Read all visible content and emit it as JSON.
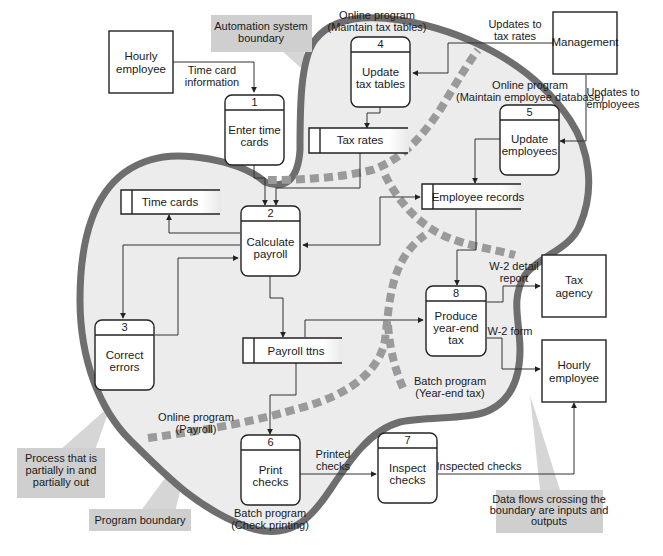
{
  "colors": {
    "automation_boundary_fill": "#ececec",
    "automation_boundary_stroke": "#6e6e6e",
    "program_boundary": "#9a9a9a",
    "callout_fill": "#cfcfcf",
    "line": "#333333"
  },
  "external_entities": [
    {
      "id": "hourly-employee-top",
      "label": [
        "Hourly",
        "employee"
      ]
    },
    {
      "id": "management",
      "label": [
        "Management"
      ]
    },
    {
      "id": "tax-agency",
      "label": [
        "Tax",
        "agency"
      ]
    },
    {
      "id": "hourly-employee-bottom",
      "label": [
        "Hourly",
        "employee"
      ]
    }
  ],
  "processes": [
    {
      "num": "1",
      "label": [
        "Enter time",
        "cards"
      ]
    },
    {
      "num": "2",
      "label": [
        "Calculate",
        "payroll"
      ]
    },
    {
      "num": "3",
      "label": [
        "Correct",
        "errors"
      ]
    },
    {
      "num": "4",
      "label": [
        "Update",
        "tax tables"
      ]
    },
    {
      "num": "5",
      "label": [
        "Update",
        "employees"
      ]
    },
    {
      "num": "6",
      "label": [
        "Print",
        "checks"
      ]
    },
    {
      "num": "7",
      "label": [
        "Inspect",
        "checks"
      ]
    },
    {
      "num": "8",
      "label": [
        "Produce",
        "year-end",
        "tax"
      ]
    }
  ],
  "data_stores": [
    {
      "label": "Time cards"
    },
    {
      "label": "Tax rates"
    },
    {
      "label": "Employee records"
    },
    {
      "label": "Payroll ttns"
    }
  ],
  "data_flows": [
    {
      "label": [
        "Time card",
        "information"
      ]
    },
    {
      "label": [
        "Updates to",
        "tax rates"
      ]
    },
    {
      "label": [
        "Updates to",
        "employees"
      ]
    },
    {
      "label": [
        "W-2 detail",
        "report"
      ]
    },
    {
      "label": [
        "W-2 form"
      ]
    },
    {
      "label": [
        "Printed",
        "checks"
      ]
    },
    {
      "label": [
        "Inspected checks"
      ]
    }
  ],
  "program_labels": [
    {
      "label": [
        "Online program",
        "(Maintain tax tables)"
      ]
    },
    {
      "label": [
        "Online program",
        "(Maintain employee database)"
      ]
    },
    {
      "label": [
        "Online program",
        "(Payroll)"
      ]
    },
    {
      "label": [
        "Batch program",
        "(Year-end tax)"
      ]
    },
    {
      "label": [
        "Batch program",
        "(Check printing)"
      ]
    }
  ],
  "callouts": [
    {
      "label": [
        "Automation system",
        "boundary"
      ]
    },
    {
      "label": [
        "Process that is",
        "partially in and",
        "partially out"
      ]
    },
    {
      "label": [
        "Program boundary"
      ]
    },
    {
      "label": [
        "Data flows crossing the",
        "boundary are inputs and",
        "outputs"
      ]
    }
  ]
}
